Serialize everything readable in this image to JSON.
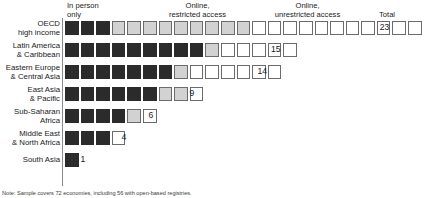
{
  "chart_data": {
    "type": "bar",
    "subtype": "stacked-unit-square-waffle",
    "title": "",
    "xlabel": "",
    "ylabel": "",
    "categories": [
      "OECD high income",
      "Latin America & Caribbean",
      "Eastern Europe & Central Asia",
      "East Asia & Pacific",
      "Sub-Saharan Africa",
      "Middle East & North Africa",
      "South Asia"
    ],
    "series": [
      {
        "name": "In person only",
        "color": "#2b2b2b",
        "values": [
          3,
          9,
          7,
          6,
          4,
          3,
          1
        ]
      },
      {
        "name": "Online, restricted access",
        "color": "#d2d2d2",
        "values": [
          9,
          1,
          1,
          2,
          1,
          0,
          0
        ]
      },
      {
        "name": "Online, unrestricted access",
        "color": "#ffffff",
        "values": [
          11,
          5,
          6,
          1,
          1,
          1,
          0
        ]
      }
    ],
    "totals": [
      23,
      15,
      14,
      9,
      6,
      4,
      1
    ],
    "unit": "1 square = 1 economy",
    "grid": false,
    "legend_position": "top-as-column-headers"
  },
  "headers": {
    "in_person": {
      "line1": "In person",
      "line2": "only"
    },
    "restricted": {
      "line1": "Online,",
      "line2": "restricted access"
    },
    "unrestricted": {
      "line1": "Online,",
      "line2": "unrestricted access"
    },
    "total": "Total"
  },
  "rows": [
    {
      "label_line1": "OECD",
      "label_line2": "high income",
      "total": "23",
      "in_person": 3,
      "restricted": 9,
      "unrestricted": 11
    },
    {
      "label_line1": "Latin America",
      "label_line2": "& Caribbean",
      "total": "15",
      "in_person": 9,
      "restricted": 1,
      "unrestricted": 5
    },
    {
      "label_line1": "Eastern Europe",
      "label_line2": "& Central Asia",
      "total": "14",
      "in_person": 7,
      "restricted": 1,
      "unrestricted": 6
    },
    {
      "label_line1": "East Asia",
      "label_line2": "& Pacific",
      "total": "9",
      "in_person": 6,
      "restricted": 2,
      "unrestricted": 1
    },
    {
      "label_line1": "Sub-Saharan",
      "label_line2": "Africa",
      "total": "6",
      "in_person": 4,
      "restricted": 1,
      "unrestricted": 1
    },
    {
      "label_line1": "Middle East",
      "label_line2": "& North Africa",
      "total": "4",
      "in_person": 3,
      "restricted": 0,
      "unrestricted": 1
    },
    {
      "label_line1": "South Asia",
      "label_line2": "",
      "total": "1",
      "in_person": 1,
      "restricted": 0,
      "unrestricted": 0
    }
  ],
  "footnote": "Note: Sample covers 72 economies, including 56 with open-based registries."
}
